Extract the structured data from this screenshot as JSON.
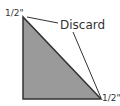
{
  "diagram": {
    "labels": {
      "top_left": "1/2\"",
      "bottom_right": "1/2\"",
      "discard": "Discard"
    },
    "colors": {
      "triangle_fill": "#9a9a9a",
      "stroke": "#333333",
      "background": "#ffffff"
    }
  }
}
